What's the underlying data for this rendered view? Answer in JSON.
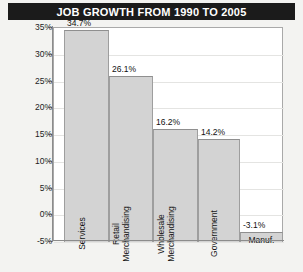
{
  "chart_data": {
    "type": "bar",
    "title": "JOB GROWTH FROM 1990 TO 2005",
    "xlabel": "",
    "ylabel": "",
    "categories": [
      "Services",
      "Retail Merchandising",
      "Wholesale Merchandising",
      "Government",
      "Manuf."
    ],
    "values": [
      34.7,
      26.1,
      16.2,
      14.2,
      -3.1
    ],
    "value_labels": [
      "34.7%",
      "26.1%",
      "16.2%",
      "14.2%",
      "-3.1%"
    ],
    "ylim": [
      -5,
      35
    ],
    "ytick_labels": [
      "35%",
      "30%",
      "25%",
      "20%",
      "15%",
      "10%",
      "5%",
      "0%",
      "-5%"
    ],
    "ytick_values": [
      35,
      30,
      25,
      20,
      15,
      10,
      5,
      0,
      -5
    ],
    "grid": true,
    "legend": "none",
    "bar_color": "#d3d3d3",
    "bar_border_color": "#9e9e9e",
    "title_background": "#1b1b1b",
    "title_color": "#ffffff",
    "plot_background": "#ffffff",
    "figure_background": "#f3f3f1"
  },
  "category_label_lines": [
    [
      "Services"
    ],
    [
      "Retail",
      "Merchandising"
    ],
    [
      "Wholesale",
      "Merchandising"
    ],
    [
      "Government"
    ],
    [
      "Manuf."
    ]
  ]
}
